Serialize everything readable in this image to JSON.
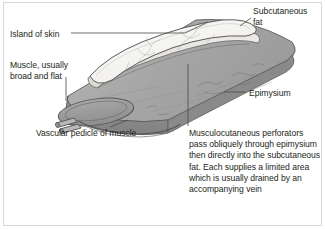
{
  "figure": {
    "labels": {
      "island_of_skin": "Island of skin",
      "muscle": "Muscle, usually\nbroad and flat",
      "subcutaneous_fat": "Subcutaneous\nfat",
      "epimysium": "Epimysium",
      "vascular_pedicle": "Vascular pedicle of muscle"
    },
    "caption": "Musculocutaneous perforators pass obliquely through epimysium then directly into the subcutaneous fat. Each supplies a limited area which is usually drained by an accompanying vein",
    "colors": {
      "background": "#ffffff",
      "frame": "#d8d8d8",
      "text": "#231f20",
      "leader_line": "#4a4a4a",
      "muscle_top": "#a9a9a9",
      "muscle_side": "#8f8f8f",
      "muscle_end": "#9a9a9a",
      "skin_island": "#f4f3f1",
      "fat_layer": "#e8e6e2",
      "outline": "#5a5a5a",
      "vessel": "#7a7a7a"
    }
  }
}
